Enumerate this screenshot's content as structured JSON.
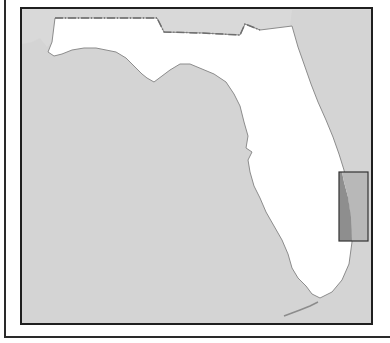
{
  "map": {
    "region": "Florida",
    "colors": {
      "water": "#d4d4d4",
      "land": "#ffffff",
      "coastline": "#8c8c8c",
      "state_border": "#6e6e6e",
      "highlight_land": "#8e8e8e",
      "highlight_water": "#b8b8b8",
      "highlight_stroke": "#333333",
      "frame": "#1f1f1f"
    },
    "highlight": {
      "label": "Southeast Florida coastal area",
      "x": 317,
      "y": 163,
      "width": 29,
      "height": 69
    }
  }
}
